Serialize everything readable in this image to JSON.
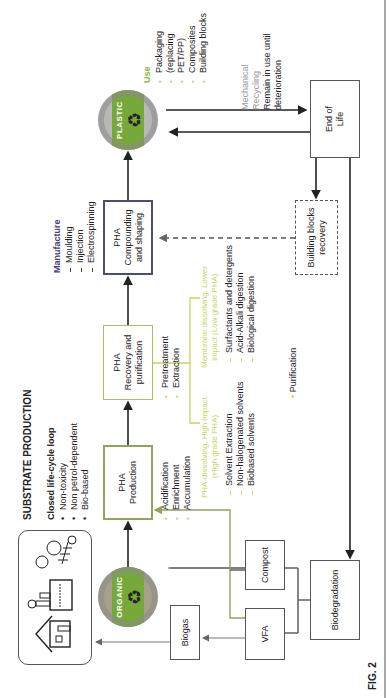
{
  "figure": {
    "label": "FIG. 2",
    "title": "SUBSTRATE PRODUCTION",
    "closed_loop": {
      "heading": "Closed life-cycle loop",
      "items": [
        "Non-toxicity",
        "Non petrol-dependent",
        "Bio-based"
      ]
    }
  },
  "circles": {
    "plastic": {
      "label": "PLASTIC",
      "icon": "recycle-icon"
    },
    "organic": {
      "label": "ORGANIC",
      "icon": "recycle-icon"
    }
  },
  "boxes": {
    "pha_production": {
      "line1": "PHA",
      "line2": "Production"
    },
    "pha_recovery": {
      "line1": "PHA",
      "line2": "Recovery and",
      "line3": "purification"
    },
    "pha_compounding": {
      "line1": "PHA",
      "line2": "Compounding",
      "line3": "and shaping"
    },
    "end_of_life": {
      "line1": "End of",
      "line2": "Life"
    },
    "building_blocks": {
      "line1": "Building blocks",
      "line2": "recovery"
    },
    "biogas": {
      "label": "Biogas"
    },
    "vfa": {
      "label": "VFA"
    },
    "compost": {
      "label": "Compost"
    },
    "biodegradation": {
      "label": "Biodegradation"
    },
    "icons_panel": {
      "icons": [
        "house-icon",
        "factory-icon",
        "food-waste-icon"
      ]
    }
  },
  "production_steps": [
    "Acidification",
    "Enrichment",
    "Accumulation"
  ],
  "recovery_steps": [
    "Pretreatment",
    "Extraction"
  ],
  "purification_label": "Purification",
  "high_grade": {
    "heading_line1": "PHA-dissolving. High impact.",
    "heading_line2": "(High grade PHA)",
    "items": [
      "Solvent Extraction",
      "Non-halogenated solvents",
      "Biobased solvents"
    ]
  },
  "low_grade": {
    "heading_line1": "Membrane dissolving. Lower",
    "heading_line2": "impact (Low grade PHA)",
    "items": [
      "Surfactants and detergents",
      "Acid-Alkali digestion",
      "Biological digestion"
    ]
  },
  "manufacture": {
    "heading": "Manufacture",
    "items": [
      "Moulding",
      "Injection",
      "Electrospinning"
    ]
  },
  "use": {
    "heading": "Use",
    "items": [
      "Packaging",
      "(replacing",
      "PET/PP)",
      "Composites",
      "Building blocks"
    ]
  },
  "end_of_life_route": {
    "line1": "Mechanical",
    "line2": "Recycling",
    "line3": "Remain in use until",
    "line4": "deterioration"
  },
  "colors": {
    "green_accent": "#8ab33d",
    "lime_text": "#c9d35c",
    "navy": "#3f3f75",
    "box_border": "#555555",
    "circle_green": "#76a83a"
  }
}
